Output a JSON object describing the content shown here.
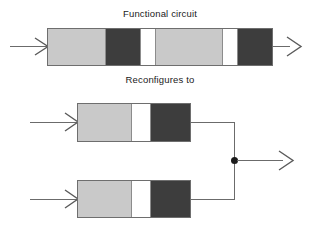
{
  "figure": {
    "captions": {
      "top": "Functional circuit",
      "middle": "Reconfigures to"
    }
  },
  "colors": {
    "light_segment": "#c9c9c9",
    "dark_segment": "#3d3d3d",
    "white_segment": "#ffffff",
    "outline": "#6e6e6e",
    "wire": "#6b6b6b",
    "junction": "#1b1b1b",
    "text": "#1a1a1a",
    "background": "#ffffff"
  },
  "functional_circuit": {
    "label": "Functional circuit",
    "segments": [
      {
        "fill": "light",
        "name": "segment-light-1"
      },
      {
        "fill": "dark",
        "name": "segment-dark-1"
      },
      {
        "fill": "white",
        "name": "segment-white-1"
      },
      {
        "fill": "light",
        "name": "segment-light-2"
      },
      {
        "fill": "white",
        "name": "segment-white-2"
      },
      {
        "fill": "dark",
        "name": "segment-dark-2"
      }
    ],
    "input_arrow": "input-arrow",
    "output_arrow": "output-arrow"
  },
  "reconfigured_circuit": {
    "label": "Reconfigures to",
    "branches": [
      {
        "name": "branch-top",
        "segments": [
          {
            "fill": "light",
            "name": "segment-light"
          },
          {
            "fill": "white",
            "name": "segment-white"
          },
          {
            "fill": "dark",
            "name": "segment-dark"
          }
        ],
        "input_arrow": "input-arrow-top"
      },
      {
        "name": "branch-bottom",
        "segments": [
          {
            "fill": "light",
            "name": "segment-light"
          },
          {
            "fill": "white",
            "name": "segment-white"
          },
          {
            "fill": "dark",
            "name": "segment-dark"
          }
        ],
        "input_arrow": "input-arrow-bottom"
      }
    ],
    "junction": "junction-dot",
    "output_arrow": "output-arrow"
  }
}
